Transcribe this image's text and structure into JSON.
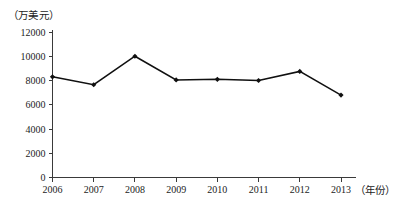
{
  "chart_data": {
    "type": "line",
    "title": "",
    "xlabel": "（年份）",
    "ylabel": "（万美元）",
    "categories": [
      "2006",
      "2007",
      "2008",
      "2009",
      "2010",
      "2011",
      "2012",
      "2013"
    ],
    "values": [
      8300,
      7650,
      10000,
      8050,
      8100,
      8000,
      8750,
      6800
    ],
    "series": [
      {
        "name": "",
        "values": [
          8300,
          7650,
          10000,
          8050,
          8100,
          8000,
          8750,
          6800
        ]
      }
    ],
    "ylim": [
      0,
      12000
    ],
    "y_ticks": [
      "0",
      "2000",
      "4000",
      "6000",
      "8000",
      "10000",
      "12000"
    ],
    "y_tick_values": [
      0,
      2000,
      4000,
      6000,
      8000,
      10000,
      12000
    ],
    "x_ticks": [
      "2006",
      "2007",
      "2008",
      "2009",
      "2010",
      "2011",
      "2012",
      "2013"
    ],
    "grid": false,
    "legend": "none",
    "marker": "filled-diamond",
    "line_color": "#101010",
    "axis_color": "#3a3a3a",
    "background_color": "#ffffff"
  },
  "axes": {
    "y_unit_caption": "（万美元）",
    "x_unit_caption": "（年份）"
  }
}
